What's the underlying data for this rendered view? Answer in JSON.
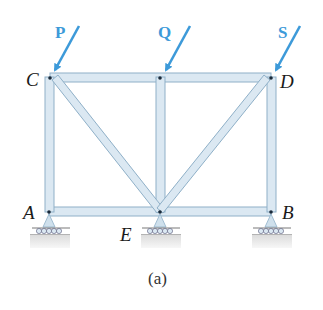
{
  "figure": {
    "caption": "(a)",
    "nodes": {
      "C": {
        "label": "C",
        "x": 50,
        "y": 77
      },
      "D": {
        "label": "D",
        "x": 271,
        "y": 77
      },
      "A": {
        "label": "A",
        "x": 49,
        "y": 212
      },
      "E": {
        "label": "E",
        "x": 160,
        "y": 212
      },
      "B": {
        "label": "B",
        "x": 271,
        "y": 212
      }
    },
    "members": [
      [
        "C",
        "D"
      ],
      [
        "A",
        "E"
      ],
      [
        "E",
        "B"
      ],
      [
        "A",
        "C"
      ],
      [
        "B",
        "D"
      ],
      [
        "C",
        "E"
      ],
      [
        "E",
        "D"
      ],
      [
        "E",
        "Q"
      ]
    ],
    "loads": [
      {
        "label": "P",
        "at": "C"
      },
      {
        "label": "Q",
        "at": "top-mid"
      },
      {
        "label": "S",
        "at": "D"
      }
    ],
    "supports": [
      "A",
      "E",
      "B"
    ],
    "colors": {
      "member_fill": "#dbe8f2",
      "member_edge": "#8fb0c8",
      "load_arrow": "#3d9ad9",
      "support_base": "#e6e6e6"
    }
  }
}
